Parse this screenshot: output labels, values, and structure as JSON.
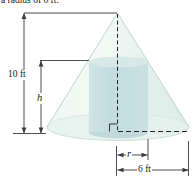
{
  "caption": "a radius of 6 ft.",
  "figure": {
    "cone_height_label": "10 ft",
    "cylinder_height_label": "h",
    "cylinder_radius_label": "r",
    "cone_radius_label": "6 ft"
  },
  "colors": {
    "background": "#ffffff",
    "cone_fill": "#e3efe9",
    "cone_edge": "#c0d7d0",
    "base_fill": "#dcebe5",
    "cylinder_fill": "#aed0d4",
    "cylinder_top_fill": "#c6dee0",
    "cylinder_bottom_fill": "#a5c9cd",
    "dimension_line": "#3a3a3a",
    "text": "#1a1a1a"
  }
}
